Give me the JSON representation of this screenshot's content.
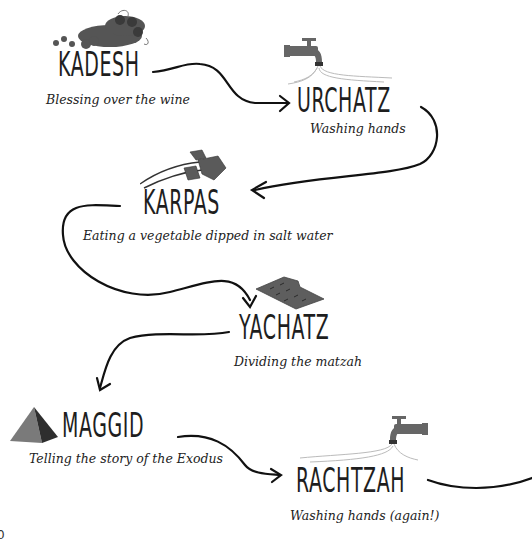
{
  "diagram": {
    "type": "flowchart",
    "topic": "Passover Seder order",
    "steps": [
      {
        "title": "KADESH",
        "description": "Blessing over the wine",
        "icon": "grapes-icon"
      },
      {
        "title": "URCHATZ",
        "description": "Washing hands",
        "icon": "faucet-icon"
      },
      {
        "title": "KARPAS",
        "description": "Eating a vegetable dipped in salt water",
        "icon": "parsley-icon"
      },
      {
        "title": "YACHATZ",
        "description": "Dividing the matzah",
        "icon": "matzah-icon"
      },
      {
        "title": "MAGGID",
        "description": "Telling the story of the Exodus",
        "icon": "pyramid-icon"
      },
      {
        "title": "RACHTZAH",
        "description": "Washing hands (again!)",
        "icon": "faucet-icon"
      }
    ],
    "edges": [
      {
        "from": "KADESH",
        "to": "URCHATZ"
      },
      {
        "from": "URCHATZ",
        "to": "KARPAS"
      },
      {
        "from": "KARPAS",
        "to": "YACHATZ"
      },
      {
        "from": "YACHATZ",
        "to": "MAGGID"
      },
      {
        "from": "MAGGID",
        "to": "RACHTZAH"
      },
      {
        "from": "RACHTZAH",
        "to": "continues-offscreen"
      }
    ],
    "stray_glyph": "0"
  }
}
